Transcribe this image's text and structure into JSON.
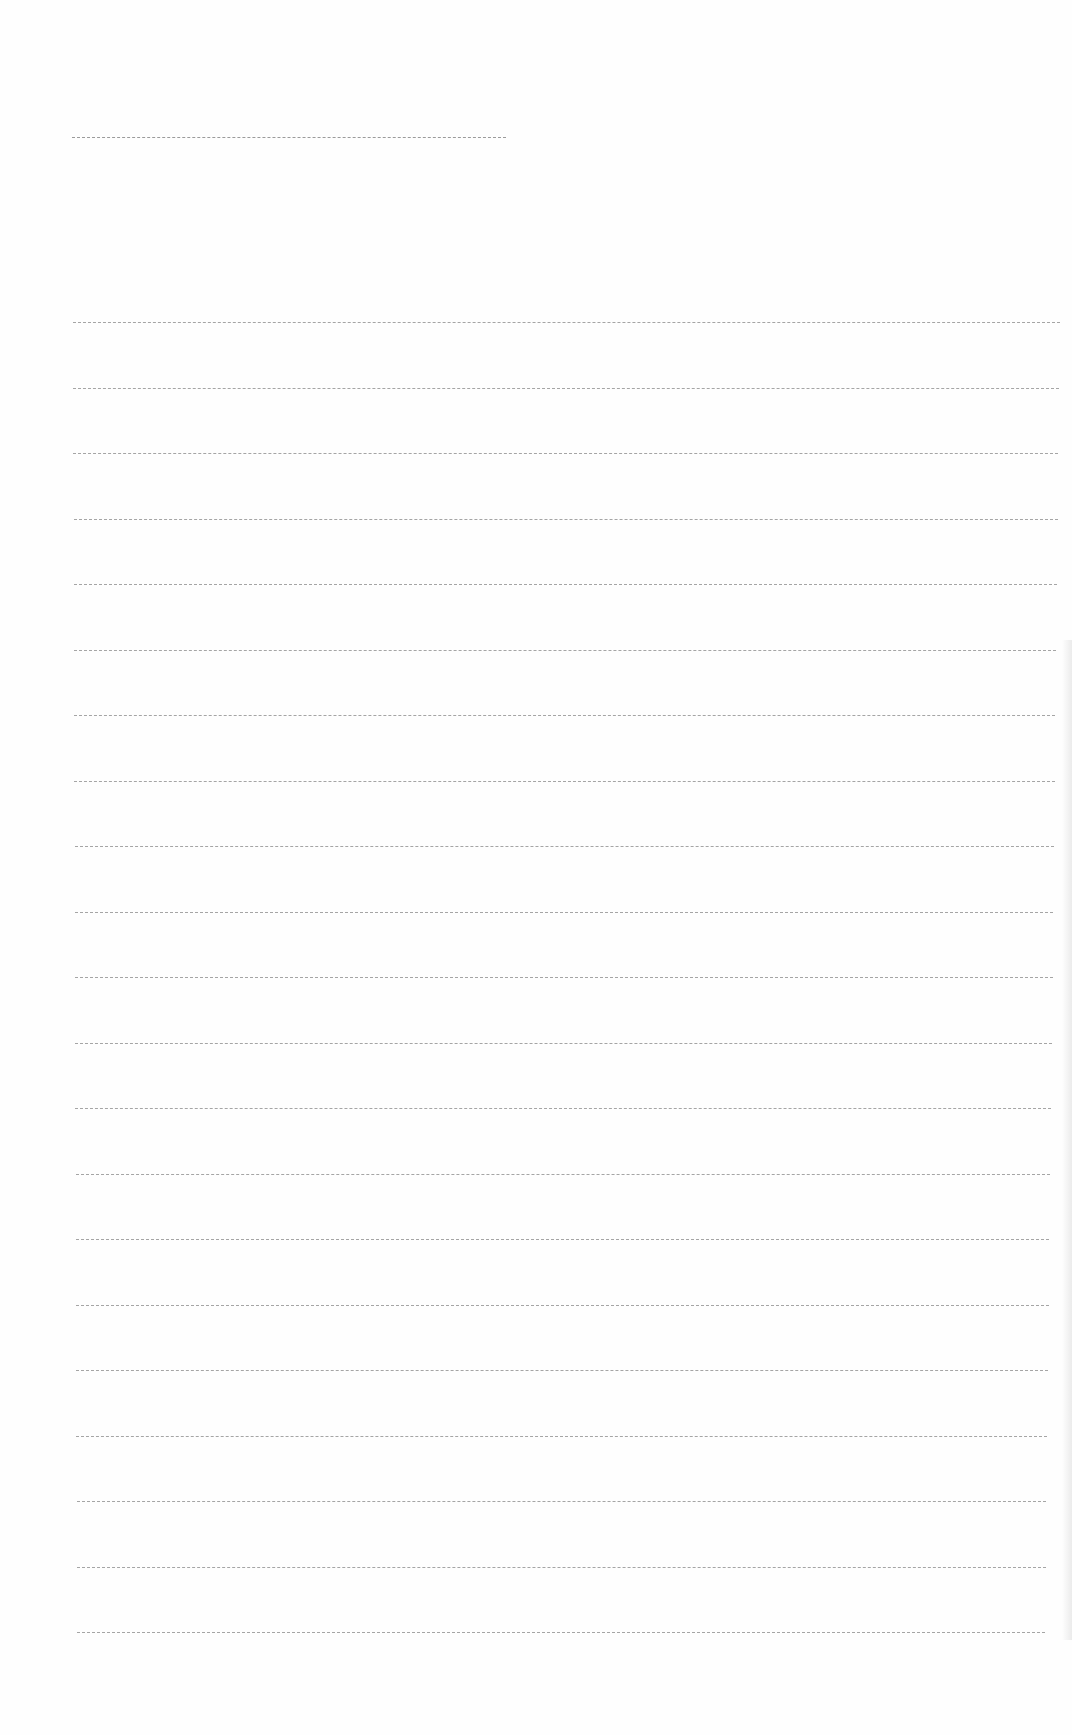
{
  "page": {
    "type": "blank ruled paper",
    "background_color": "#fefefe",
    "line_color": "#8f8f8f",
    "header_line": {
      "x": 72,
      "y": 137,
      "width": 434
    },
    "ruled_lines": {
      "count": 21,
      "first_y": 322,
      "spacing": 65.5,
      "left_x": 73,
      "right_x_top": 1060,
      "right_x_bottom": 1045
    }
  }
}
